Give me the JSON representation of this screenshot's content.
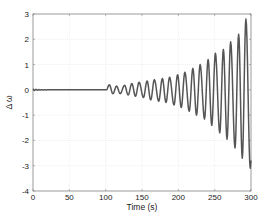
{
  "chart_data": {
    "type": "line",
    "title": "",
    "xlabel": "Time (s)",
    "ylabel": "Δ ω",
    "xlim": [
      0,
      300
    ],
    "ylim": [
      -4,
      3
    ],
    "xticks": [
      0,
      50,
      100,
      150,
      200,
      250,
      300
    ],
    "yticks": [
      -4,
      -3,
      -2,
      -1,
      0,
      1,
      2,
      3
    ],
    "grid": true,
    "legend": null,
    "line_color": "#555555",
    "series": [
      {
        "name": "Δω",
        "description": "Near-zero until ~102 s, then growing oscillation with period ~10.5 s; amplitude rises from ~0.15 to ~2.8 (peak) / -3.1 (trough) at 300 s",
        "x": [
          0,
          3,
          6,
          9,
          12,
          15,
          20,
          40,
          60,
          80,
          100,
          102,
          105,
          110,
          115,
          120,
          125,
          130,
          135,
          140,
          145,
          150,
          155,
          160,
          165,
          170,
          175,
          180,
          185,
          190,
          195,
          200,
          205,
          210,
          215,
          220,
          225,
          230,
          235,
          240,
          245,
          250,
          255,
          260,
          265,
          270,
          275,
          280,
          285,
          290,
          295,
          300
        ],
        "peaks": [
          {
            "t": 105,
            "v": 0.2
          },
          {
            "t": 115,
            "v": 0.15
          },
          {
            "t": 126,
            "v": 0.18
          },
          {
            "t": 136,
            "v": 0.25
          },
          {
            "t": 146,
            "v": 0.3
          },
          {
            "t": 157,
            "v": 0.35
          },
          {
            "t": 167,
            "v": 0.4
          },
          {
            "t": 178,
            "v": 0.45
          },
          {
            "t": 188,
            "v": 0.5
          },
          {
            "t": 199,
            "v": 0.6
          },
          {
            "t": 209,
            "v": 0.7
          },
          {
            "t": 220,
            "v": 0.85
          },
          {
            "t": 230,
            "v": 1.0
          },
          {
            "t": 241,
            "v": 1.2
          },
          {
            "t": 251,
            "v": 1.45
          },
          {
            "t": 262,
            "v": 1.6
          },
          {
            "t": 272,
            "v": 1.9
          },
          {
            "t": 283,
            "v": 2.2
          },
          {
            "t": 293,
            "v": 2.8
          }
        ],
        "troughs": [
          {
            "t": 110,
            "v": -0.15
          },
          {
            "t": 120,
            "v": -0.15
          },
          {
            "t": 131,
            "v": -0.2
          },
          {
            "t": 141,
            "v": -0.25
          },
          {
            "t": 152,
            "v": -0.3
          },
          {
            "t": 162,
            "v": -0.4
          },
          {
            "t": 173,
            "v": -0.45
          },
          {
            "t": 183,
            "v": -0.5
          },
          {
            "t": 194,
            "v": -0.6
          },
          {
            "t": 204,
            "v": -0.7
          },
          {
            "t": 215,
            "v": -0.85
          },
          {
            "t": 225,
            "v": -1.0
          },
          {
            "t": 236,
            "v": -1.15
          },
          {
            "t": 246,
            "v": -1.4
          },
          {
            "t": 257,
            "v": -1.7
          },
          {
            "t": 267,
            "v": -1.95
          },
          {
            "t": 278,
            "v": -2.3
          },
          {
            "t": 288,
            "v": -2.7
          },
          {
            "t": 299,
            "v": -3.1
          }
        ]
      }
    ]
  },
  "plot_area": {
    "left": 33,
    "top": 14,
    "right": 251,
    "bottom": 191
  }
}
